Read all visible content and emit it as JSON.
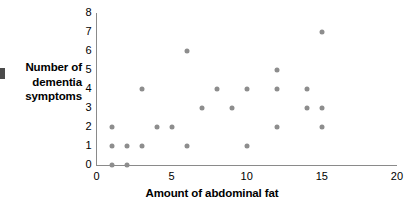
{
  "chart_data": {
    "type": "scatter",
    "title": "",
    "xlabel": "Amount of abdominal fat",
    "ylabel": "Number of dementia symptoms",
    "ylabel_lines": [
      "Number of",
      "dementia",
      "symptoms"
    ],
    "xlim": [
      0,
      20
    ],
    "ylim": [
      0,
      8
    ],
    "xticks": [
      0,
      5,
      10,
      15,
      20
    ],
    "yticks": [
      0,
      1,
      2,
      3,
      4,
      5,
      6,
      7,
      8
    ],
    "xtick_labels": [
      "0",
      "5",
      "10",
      "15",
      "20"
    ],
    "ytick_labels": [
      "0",
      "1",
      "2",
      "3",
      "4",
      "5",
      "6",
      "7",
      "8"
    ],
    "grid": false,
    "legend": false,
    "marker_color": "#8d8d8d",
    "axis_color": "#8a8a8a",
    "points": [
      {
        "x": 1,
        "y": 0
      },
      {
        "x": 2,
        "y": 0
      },
      {
        "x": 1,
        "y": 1
      },
      {
        "x": 2,
        "y": 1
      },
      {
        "x": 3,
        "y": 1
      },
      {
        "x": 6,
        "y": 1
      },
      {
        "x": 10,
        "y": 1
      },
      {
        "x": 1,
        "y": 2
      },
      {
        "x": 4,
        "y": 2
      },
      {
        "x": 5,
        "y": 2
      },
      {
        "x": 12,
        "y": 2
      },
      {
        "x": 15,
        "y": 2
      },
      {
        "x": 7,
        "y": 3
      },
      {
        "x": 9,
        "y": 3
      },
      {
        "x": 14,
        "y": 3
      },
      {
        "x": 15,
        "y": 3
      },
      {
        "x": 3,
        "y": 4
      },
      {
        "x": 8,
        "y": 4
      },
      {
        "x": 10,
        "y": 4
      },
      {
        "x": 12,
        "y": 4
      },
      {
        "x": 14,
        "y": 4
      },
      {
        "x": 12,
        "y": 5
      },
      {
        "x": 6,
        "y": 6
      },
      {
        "x": 15,
        "y": 7
      }
    ]
  }
}
